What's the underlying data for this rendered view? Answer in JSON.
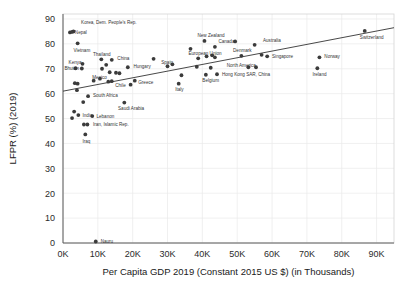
{
  "chart_data": {
    "type": "scatter",
    "title": "",
    "xlabel": "Per Capita GDP 2019 (Constant 2015 US $) (in Thousands)",
    "ylabel": "LFPR (%) (2019)",
    "xlim": [
      0,
      95
    ],
    "ylim": [
      0,
      92
    ],
    "xticks": [
      "0K",
      "10K",
      "20K",
      "30K",
      "40K",
      "50K",
      "60K",
      "70K",
      "80K",
      "90K"
    ],
    "xtick_values": [
      0,
      10,
      20,
      30,
      40,
      50,
      60,
      70,
      80,
      90
    ],
    "yticks": [
      "0",
      "10",
      "20",
      "30",
      "40",
      "50",
      "60",
      "70",
      "80",
      "90"
    ],
    "ytick_values": [
      0,
      10,
      20,
      30,
      40,
      50,
      60,
      70,
      80,
      90
    ],
    "grid": true,
    "legend": "none",
    "trendline": {
      "x0": 0,
      "y0": 61.0,
      "x1": 95,
      "y1": 86.5
    },
    "points": [
      {
        "label": "Korea, Dem. People's Rep.",
        "x": 3.0,
        "y": 85.0,
        "lx": 5.2,
        "ly": 88.6,
        "anchor": "start"
      },
      {
        "label": "Nepal",
        "x": 2.0,
        "y": 84.6,
        "lx": 3.4,
        "ly": 84.8,
        "anchor": "start"
      },
      {
        "label": "",
        "x": 2.6,
        "y": 84.8,
        "lx": 0,
        "ly": 0,
        "anchor": "start"
      },
      {
        "label": "Vietnam",
        "x": 4.2,
        "y": 80.2,
        "lx": 3.0,
        "ly": 77.4,
        "anchor": "start"
      },
      {
        "label": "Kenya",
        "x": 5.6,
        "y": 72.0,
        "lx": 1.6,
        "ly": 72.6,
        "anchor": "start"
      },
      {
        "label": "Bhutan",
        "x": 3.6,
        "y": 70.2,
        "lx": 0.4,
        "ly": 70.0,
        "anchor": "start"
      },
      {
        "label": "",
        "x": 5.4,
        "y": 70.1,
        "lx": 0,
        "ly": 0,
        "anchor": "start"
      },
      {
        "label": "Thailand",
        "x": 11.0,
        "y": 73.8,
        "lx": 8.6,
        "ly": 75.6,
        "anchor": "start"
      },
      {
        "label": "China",
        "x": 14.0,
        "y": 73.6,
        "lx": 15.6,
        "ly": 74.2,
        "anchor": "start"
      },
      {
        "label": "",
        "x": 12.4,
        "y": 71.6,
        "lx": 0,
        "ly": 0,
        "anchor": "start"
      },
      {
        "label": "",
        "x": 11.2,
        "y": 70.0,
        "lx": 0,
        "ly": 0,
        "anchor": "start"
      },
      {
        "label": "",
        "x": 13.4,
        "y": 68.6,
        "lx": 0,
        "ly": 0,
        "anchor": "start"
      },
      {
        "label": "Hungary",
        "x": 18.6,
        "y": 70.6,
        "lx": 20.2,
        "ly": 70.8,
        "anchor": "start"
      },
      {
        "label": "",
        "x": 26.0,
        "y": 74.0,
        "lx": 0,
        "ly": 0,
        "anchor": "start"
      },
      {
        "label": "",
        "x": 31.4,
        "y": 71.8,
        "lx": 0,
        "ly": 0,
        "anchor": "start"
      },
      {
        "label": "Mexico",
        "x": 10.6,
        "y": 66.0,
        "lx": 8.4,
        "ly": 66.6,
        "anchor": "start"
      },
      {
        "label": "",
        "x": 8.8,
        "y": 65.2,
        "lx": 0,
        "ly": 0,
        "anchor": "start"
      },
      {
        "label": "",
        "x": 15.2,
        "y": 68.4,
        "lx": 0,
        "ly": 0,
        "anchor": "start"
      },
      {
        "label": "",
        "x": 16.2,
        "y": 68.2,
        "lx": 0,
        "ly": 0,
        "anchor": "start"
      },
      {
        "label": "Chile",
        "x": 14.0,
        "y": 65.0,
        "lx": 15.0,
        "ly": 63.2,
        "anchor": "start"
      },
      {
        "label": "",
        "x": 13.0,
        "y": 64.8,
        "lx": 0,
        "ly": 0,
        "anchor": "start"
      },
      {
        "label": "Greece",
        "x": 20.6,
        "y": 65.2,
        "lx": 21.6,
        "ly": 64.4,
        "anchor": "start"
      },
      {
        "label": "",
        "x": 19.4,
        "y": 63.6,
        "lx": 0,
        "ly": 0,
        "anchor": "start"
      },
      {
        "label": "",
        "x": 3.4,
        "y": 64.2,
        "lx": 0,
        "ly": 0,
        "anchor": "start"
      },
      {
        "label": "",
        "x": 4.2,
        "y": 64.0,
        "lx": 0,
        "ly": 0,
        "anchor": "start"
      },
      {
        "label": "",
        "x": 4.0,
        "y": 61.4,
        "lx": 0,
        "ly": 0,
        "anchor": "start"
      },
      {
        "label": "South Africa",
        "x": 7.2,
        "y": 59.0,
        "lx": 8.6,
        "ly": 59.2,
        "anchor": "start"
      },
      {
        "label": "",
        "x": 5.8,
        "y": 56.6,
        "lx": 0,
        "ly": 0,
        "anchor": "start"
      },
      {
        "label": "Saudi Arabia",
        "x": 17.6,
        "y": 56.4,
        "lx": 15.8,
        "ly": 54.0,
        "anchor": "start"
      },
      {
        "label": "India",
        "x": 4.4,
        "y": 51.4,
        "lx": 5.6,
        "ly": 51.4,
        "anchor": "start"
      },
      {
        "label": "",
        "x": 3.2,
        "y": 52.8,
        "lx": 0,
        "ly": 0,
        "anchor": "start"
      },
      {
        "label": "",
        "x": 2.6,
        "y": 50.2,
        "lx": 0,
        "ly": 0,
        "anchor": "start"
      },
      {
        "label": "Lebanon",
        "x": 8.4,
        "y": 51.0,
        "lx": 9.6,
        "ly": 50.8,
        "anchor": "start"
      },
      {
        "label": "Iran, Islamic Rep.",
        "x": 7.0,
        "y": 47.6,
        "lx": 8.6,
        "ly": 47.6,
        "anchor": "start"
      },
      {
        "label": "",
        "x": 6.0,
        "y": 47.6,
        "lx": 0,
        "ly": 0,
        "anchor": "start"
      },
      {
        "label": "Iraq",
        "x": 6.4,
        "y": 43.6,
        "lx": 5.6,
        "ly": 40.8,
        "anchor": "start"
      },
      {
        "label": "Spain",
        "x": 30.0,
        "y": 71.0,
        "lx": 28.2,
        "ly": 72.4,
        "anchor": "start"
      },
      {
        "label": "Italy",
        "x": 33.2,
        "y": 64.0,
        "lx": 32.2,
        "ly": 61.6,
        "anchor": "start"
      },
      {
        "label": "",
        "x": 34.0,
        "y": 67.4,
        "lx": 0,
        "ly": 0,
        "anchor": "start"
      },
      {
        "label": "New Zealand",
        "x": 40.6,
        "y": 81.2,
        "lx": 38.6,
        "ly": 83.4,
        "anchor": "start"
      },
      {
        "label": "",
        "x": 36.6,
        "y": 78.0,
        "lx": 0,
        "ly": 0,
        "anchor": "start"
      },
      {
        "label": "European Union",
        "x": 38.8,
        "y": 74.2,
        "lx": 36.0,
        "ly": 76.0,
        "anchor": "start"
      },
      {
        "label": "",
        "x": 41.2,
        "y": 75.0,
        "lx": 0,
        "ly": 0,
        "anchor": "start"
      },
      {
        "label": "Canada",
        "x": 43.6,
        "y": 78.8,
        "lx": 44.6,
        "ly": 81.0,
        "anchor": "start"
      },
      {
        "label": "",
        "x": 42.8,
        "y": 75.4,
        "lx": 0,
        "ly": 0,
        "anchor": "start"
      },
      {
        "label": "",
        "x": 43.6,
        "y": 74.6,
        "lx": 0,
        "ly": 0,
        "anchor": "start"
      },
      {
        "label": "",
        "x": 38.4,
        "y": 70.8,
        "lx": 0,
        "ly": 0,
        "anchor": "start"
      },
      {
        "label": "",
        "x": 42.4,
        "y": 70.4,
        "lx": 0,
        "ly": 0,
        "anchor": "start"
      },
      {
        "label": "Belgium",
        "x": 41.0,
        "y": 67.6,
        "lx": 40.0,
        "ly": 65.2,
        "anchor": "start"
      },
      {
        "label": "Hong Kong SAR, China",
        "x": 44.2,
        "y": 67.8,
        "lx": 45.6,
        "ly": 67.8,
        "anchor": "start"
      },
      {
        "label": "North America",
        "x": 53.2,
        "y": 70.6,
        "lx": 47.0,
        "ly": 71.2,
        "anchor": "start"
      },
      {
        "label": "",
        "x": 55.4,
        "y": 70.6,
        "lx": 0,
        "ly": 0,
        "anchor": "start"
      },
      {
        "label": "Denmark",
        "x": 51.2,
        "y": 75.2,
        "lx": 48.8,
        "ly": 77.2,
        "anchor": "start"
      },
      {
        "label": "",
        "x": 49.4,
        "y": 81.0,
        "lx": 0,
        "ly": 0,
        "anchor": "start"
      },
      {
        "label": "Australia",
        "x": 55.0,
        "y": 79.6,
        "lx": 57.4,
        "ly": 81.2,
        "anchor": "start"
      },
      {
        "label": "",
        "x": 57.0,
        "y": 75.6,
        "lx": 0,
        "ly": 0,
        "anchor": "start"
      },
      {
        "label": "Singapore",
        "x": 58.6,
        "y": 75.0,
        "lx": 60.0,
        "ly": 75.0,
        "anchor": "start"
      },
      {
        "label": "Norway",
        "x": 73.6,
        "y": 74.6,
        "lx": 75.0,
        "ly": 74.8,
        "anchor": "start"
      },
      {
        "label": "Ireland",
        "x": 73.0,
        "y": 70.2,
        "lx": 71.6,
        "ly": 67.8,
        "anchor": "start"
      },
      {
        "label": "Switzerland",
        "x": 86.6,
        "y": 85.2,
        "lx": 85.2,
        "ly": 82.6,
        "anchor": "start"
      },
      {
        "label": "Nauru",
        "x": 9.4,
        "y": 0.6,
        "lx": 10.8,
        "ly": 0.6,
        "anchor": "start"
      }
    ]
  }
}
